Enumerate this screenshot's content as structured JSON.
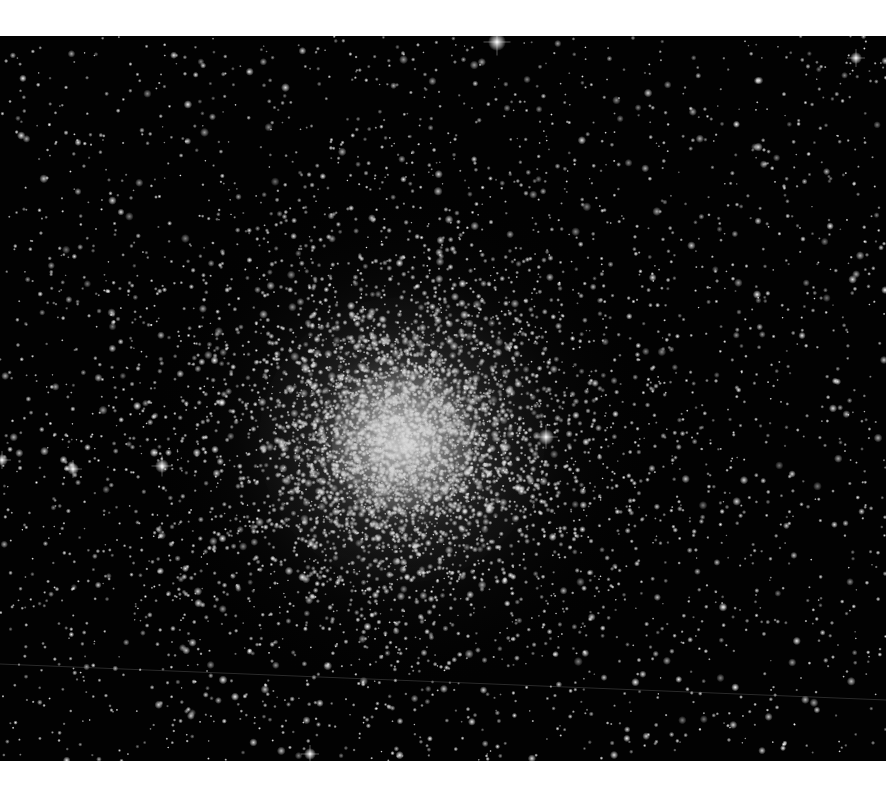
{
  "image": {
    "subject": "Globular star cluster on black starfield",
    "alt": "Dense globular star cluster with bright grey-white core surrounded by thousands of stars on a black sky",
    "frame": {
      "top": 36,
      "bottom": 761,
      "width": 886,
      "background": "#ffffff",
      "sky": "#020202"
    },
    "cluster": {
      "center_x": 402,
      "center_y": 404,
      "core_radius": 70,
      "halo_radius": 260,
      "core_color": "#c8c8c8",
      "halo_color": "#6a6a6a"
    },
    "field": {
      "seed": 7,
      "background_stars": 2600,
      "cluster_stars": 5200,
      "star_color": "#ffffff"
    },
    "bright_stars": [
      {
        "x": 497,
        "y": 6,
        "r": 4.5
      },
      {
        "x": 546,
        "y": 401,
        "r": 4
      },
      {
        "x": 162,
        "y": 430,
        "r": 3.5
      },
      {
        "x": 73,
        "y": 433,
        "r": 3
      },
      {
        "x": 856,
        "y": 22,
        "r": 3
      },
      {
        "x": 2,
        "y": 424,
        "r": 3
      },
      {
        "x": 310,
        "y": 718,
        "r": 3
      }
    ],
    "satellite_trail": {
      "x1": 0,
      "y1": 628,
      "x2": 886,
      "y2": 664,
      "color": "rgba(120,120,120,0.35)"
    }
  }
}
